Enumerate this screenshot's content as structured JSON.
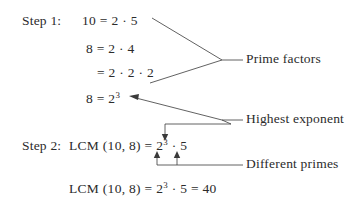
{
  "figure": {
    "background_color": "#ffffff",
    "ink_color": "#2b2b2b"
  },
  "steps": {
    "step1_label": "Step 1:",
    "step2_label": "Step 2:"
  },
  "lines": {
    "line1": {
      "lhs": "10 =",
      "rhs_a": "2",
      "dot": "·",
      "rhs_b": "5"
    },
    "line2": {
      "lhs": "8 =",
      "rhs_a": "2",
      "dot": "·",
      "rhs_b": "4"
    },
    "line3": {
      "lhs": "=",
      "a": "2",
      "dot1": "·",
      "b": "2",
      "dot2": "·",
      "c": "2"
    },
    "line4": {
      "lhs": "8 =",
      "base": "2",
      "exponent": "3"
    },
    "line5": {
      "lcm": "LCM (10, 8) =",
      "base": "2",
      "exponent": "3",
      "dot": "·",
      "factor": "5"
    },
    "line6": {
      "lcm": "LCM (10, 8) =",
      "base": "2",
      "exponent": "3",
      "dot": "·",
      "factor": "5",
      "equals": "=",
      "result": "40"
    }
  },
  "annotations": {
    "prime_factors": "Prime factors",
    "highest_exponent": "Highest exponent",
    "different_primes": "Different primes"
  }
}
